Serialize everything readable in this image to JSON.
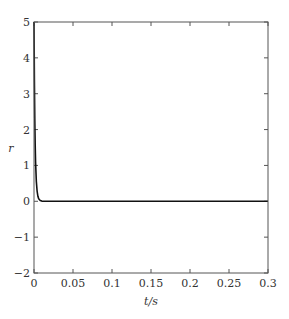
{
  "chart_data": {
    "type": "line",
    "title": "",
    "xlabel": "t/s",
    "ylabel": "r",
    "xlim": [
      0,
      0.3
    ],
    "ylim": [
      -2,
      5
    ],
    "xticks": [
      0,
      0.05,
      0.1,
      0.15,
      0.2,
      0.25,
      0.3
    ],
    "xtick_labels": [
      "0",
      "0.05",
      "0.1",
      "0.15",
      "0.2",
      "0.25",
      "0.3"
    ],
    "yticks": [
      -2,
      -1,
      0,
      1,
      2,
      3,
      4,
      5
    ],
    "ytick_labels": [
      "−2",
      "−1",
      "0",
      "1",
      "2",
      "3",
      "4",
      "5"
    ],
    "grid": false,
    "legend": null,
    "series": [
      {
        "name": "r",
        "color": "#111111",
        "x": [
          0,
          0.0005,
          0.001,
          0.0015,
          0.002,
          0.003,
          0.004,
          0.005,
          0.006,
          0.008,
          0.01,
          0.012,
          0.015,
          0.02,
          0.05,
          0.1,
          0.15,
          0.2,
          0.25,
          0.3
        ],
        "y": [
          5,
          3.4,
          2.3,
          1.6,
          1.1,
          0.55,
          0.28,
          0.14,
          0.07,
          0.02,
          0.005,
          0,
          0,
          0,
          0,
          0,
          0,
          0,
          0,
          0
        ]
      }
    ]
  }
}
